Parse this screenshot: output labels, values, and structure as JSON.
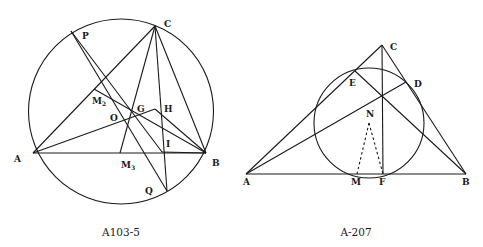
{
  "figures": [
    {
      "id": "left",
      "caption": "A103-5",
      "circle": {
        "cx": 121,
        "cy": 111.5,
        "r": 92.5
      },
      "points": {
        "A": {
          "x": 33,
          "y": 153,
          "label": "A",
          "lx": 14,
          "ly": 162
        },
        "B": {
          "x": 206,
          "y": 153,
          "label": "B",
          "lx": 212,
          "ly": 166
        },
        "C": {
          "x": 155,
          "y": 26,
          "label": "C",
          "lx": 164,
          "ly": 27
        },
        "P": {
          "x": 71,
          "y": 31,
          "label": "P",
          "lx": 82,
          "ly": 39
        },
        "Q": {
          "x": 167,
          "y": 191,
          "label": "Q",
          "lx": 145,
          "ly": 194
        },
        "M2": {
          "x": 94,
          "y": 89,
          "label": "M",
          "sub": "2",
          "lx": 92,
          "ly": 104
        },
        "G": {
          "x": 134,
          "y": 113,
          "label": "G",
          "lx": 137,
          "ly": 112
        },
        "H": {
          "x": 155,
          "y": 109,
          "label": "H",
          "lx": 164,
          "ly": 112
        },
        "O": {
          "x": 127,
          "y": 124,
          "label": "O",
          "lx": 110,
          "ly": 121
        },
        "I": {
          "x": 162,
          "y": 152,
          "label": "I",
          "lx": 166,
          "ly": 147
        },
        "M3": {
          "x": 120,
          "y": 153,
          "label": "M",
          "sub": "3",
          "lx": 121,
          "ly": 168
        }
      },
      "segments": [
        [
          "A",
          "B"
        ],
        [
          "A",
          "C"
        ],
        [
          "B",
          "C"
        ],
        [
          "C",
          "M3"
        ],
        [
          "C",
          "Q"
        ],
        [
          "A",
          "H"
        ],
        [
          "H",
          "B"
        ],
        [
          "M2",
          "B"
        ],
        [
          "P",
          "Q"
        ],
        [
          "P",
          "I"
        ],
        [
          "I",
          "B"
        ]
      ]
    },
    {
      "id": "right",
      "caption": "A-207",
      "circle": {
        "cx": 369,
        "cy": 123,
        "r": 55
      },
      "points": {
        "A": {
          "x": 246,
          "y": 174,
          "label": "A",
          "lx": 243,
          "ly": 185
        },
        "B": {
          "x": 466,
          "y": 174,
          "label": "B",
          "lx": 462,
          "ly": 185
        },
        "C": {
          "x": 382,
          "y": 45,
          "label": "C",
          "lx": 390,
          "ly": 50
        },
        "E": {
          "x": 355,
          "y": 71,
          "label": "E",
          "lx": 349,
          "ly": 86
        },
        "D": {
          "x": 406,
          "y": 82,
          "label": "D",
          "lx": 414,
          "ly": 87
        },
        "Hc": {
          "x": 382,
          "y": 96,
          "label": ""
        },
        "N": {
          "x": 369,
          "y": 123,
          "label": "N",
          "lx": 366,
          "ly": 117
        },
        "M": {
          "x": 357,
          "y": 174,
          "label": "M",
          "lx": 351,
          "ly": 185
        },
        "F": {
          "x": 383,
          "y": 174,
          "label": "F",
          "lx": 379,
          "ly": 185
        }
      },
      "segments": [
        [
          "A",
          "B"
        ],
        [
          "A",
          "C"
        ],
        [
          "B",
          "C"
        ],
        [
          "C",
          "F"
        ],
        [
          "A",
          "D"
        ],
        [
          "B",
          "E"
        ]
      ],
      "dashed": [
        [
          "N",
          "M"
        ],
        [
          "N",
          "F"
        ]
      ]
    }
  ]
}
